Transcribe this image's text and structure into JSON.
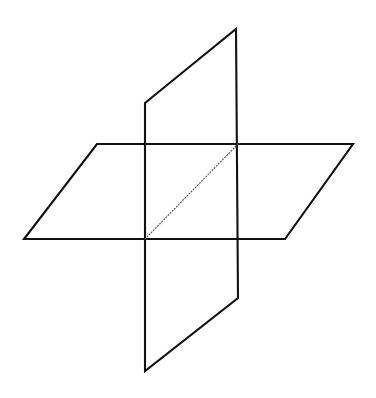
{
  "figure": {
    "title": "Two intersecting planes in three-dimensional space",
    "canvas": {
      "width": 376,
      "height": 398,
      "background_color": "#ffffff"
    },
    "style": {
      "solid_stroke_color": "#111111",
      "solid_stroke_width": 2.1,
      "dotted_stroke_color": "#4a4a4a",
      "dotted_stroke_width": 1.1,
      "dotted_dash_pattern": "1 2"
    },
    "shapes": [
      {
        "id": "horizontal-plane",
        "name": "horizontal parallelogram plane",
        "kind": "parallelogram",
        "line_style": "solid",
        "points": "97,144 353,144 285,239 24,239",
        "vertices": [
          {
            "label": "top-left",
            "x": 97,
            "y": 144
          },
          {
            "label": "top-right",
            "x": 353,
            "y": 144
          },
          {
            "label": "bottom-right",
            "x": 285,
            "y": 239
          },
          {
            "label": "bottom-left",
            "x": 24,
            "y": 239
          }
        ]
      },
      {
        "id": "vertical-plane",
        "name": "vertical parallelogram plane",
        "kind": "parallelogram",
        "line_style": "solid",
        "points": "145,103 236,29 238,298 145,371",
        "vertices": [
          {
            "label": "upper-left",
            "x": 145,
            "y": 103
          },
          {
            "label": "upper-right",
            "x": 236,
            "y": 29
          },
          {
            "label": "lower-right",
            "x": 238,
            "y": 298
          },
          {
            "label": "lower-left",
            "x": 145,
            "y": 371
          }
        ]
      }
    ],
    "lines": [
      {
        "id": "diagonal-dotted",
        "name": "dotted diagonal of intersection region",
        "line_style": "dotted",
        "x1": 145,
        "y1": 239,
        "x2": 238,
        "y2": 144
      }
    ],
    "intersection_points": [
      {
        "label": "front-left",
        "x": 145,
        "y": 239
      },
      {
        "label": "back-left",
        "x": 145,
        "y": 144
      },
      {
        "label": "back-right",
        "x": 238,
        "y": 144
      },
      {
        "label": "front-right",
        "x": 238,
        "y": 239
      }
    ]
  }
}
